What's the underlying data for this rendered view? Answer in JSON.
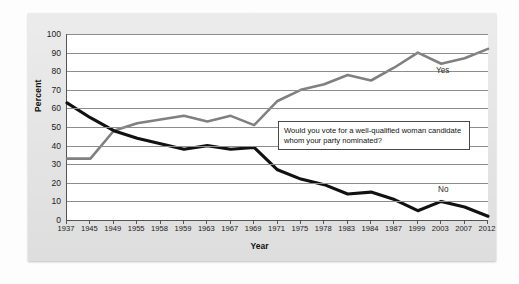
{
  "figure": {
    "background_color": "#dcdcdc",
    "plot_background_color": "#ffffff"
  },
  "annotation": {
    "text": "Would you vote for a well-qualified woman candidate whom your party nominated?"
  },
  "labels": {
    "yes": "Yes",
    "no": "No"
  },
  "chart_data": {
    "type": "line",
    "title": "",
    "xlabel": "Year",
    "ylabel": "Percent",
    "ylim": [
      0,
      100
    ],
    "yticks": [
      0,
      10,
      20,
      30,
      40,
      50,
      60,
      70,
      80,
      90,
      100
    ],
    "grid": true,
    "legend_position": "inline-right",
    "annotations": [
      "Would you vote for a well-qualified woman candidate whom your party nominated?"
    ],
    "categories": [
      "1937",
      "1945",
      "1949",
      "1955",
      "1958",
      "1959",
      "1963",
      "1967",
      "1969",
      "1971",
      "1975",
      "1978",
      "1983",
      "1984",
      "1987",
      "1999",
      "2003",
      "2007",
      "2012"
    ],
    "series": [
      {
        "name": "Yes",
        "color": "#808080",
        "values": [
          33,
          33,
          48,
          52,
          54,
          56,
          53,
          56,
          51,
          64,
          70,
          73,
          78,
          75,
          82,
          90,
          84,
          87,
          92
        ]
      },
      {
        "name": "No",
        "color": "#111111",
        "values": [
          63,
          55,
          48,
          44,
          41,
          38,
          40,
          38,
          39,
          27,
          22,
          19,
          14,
          15,
          11,
          5,
          10,
          7,
          2
        ]
      }
    ]
  }
}
